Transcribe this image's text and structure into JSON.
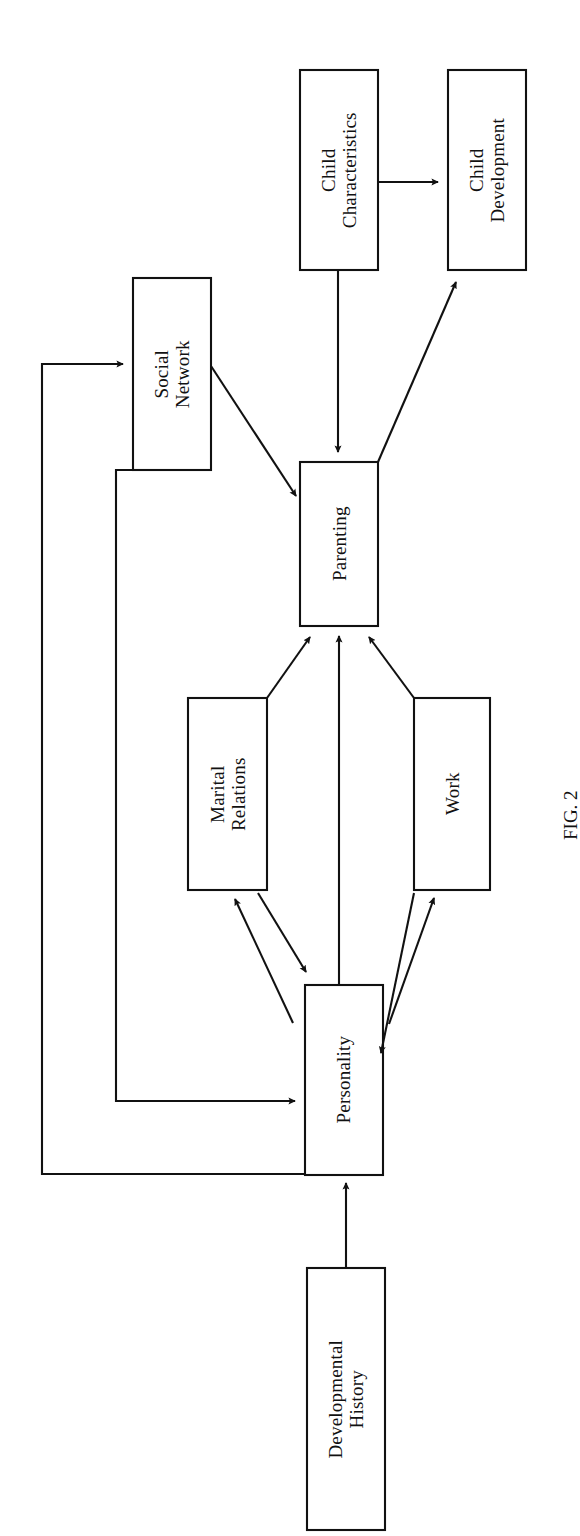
{
  "figure": {
    "caption": "FIG. 2",
    "orientation_degrees": -90,
    "background_color": "#ffffff",
    "line_color": "#111111",
    "text_color": "#111111"
  },
  "nodes": [
    {
      "id": "child-characteristics",
      "label": "Child\nCharacteristics",
      "x": 300,
      "y": 70,
      "w": 78,
      "h": 200
    },
    {
      "id": "child-development",
      "label": "Child\nDevelopment",
      "x": 448,
      "y": 70,
      "w": 78,
      "h": 200
    },
    {
      "id": "social-network",
      "label": "Social\nNetwork",
      "x": 133,
      "y": 278,
      "w": 78,
      "h": 192
    },
    {
      "id": "parenting",
      "label": "Parenting",
      "x": 300,
      "y": 462,
      "w": 78,
      "h": 164
    },
    {
      "id": "marital-relations",
      "label": "Marital\nRelations",
      "x": 188,
      "y": 698,
      "w": 79,
      "h": 192
    },
    {
      "id": "work",
      "label": "Work",
      "x": 414,
      "y": 698,
      "w": 76,
      "h": 192
    },
    {
      "id": "personality",
      "label": "Personality",
      "x": 305,
      "y": 985,
      "w": 78,
      "h": 190
    },
    {
      "id": "developmental-history",
      "label": "Developmental\nHistory",
      "x": 307,
      "y": 1268,
      "w": 78,
      "h": 262
    }
  ],
  "edges": [
    {
      "id": "developmental-history-to-personality",
      "from": "developmental-history",
      "to": "personality",
      "arrows": "one-way"
    },
    {
      "id": "personality-to-parenting",
      "from": "personality",
      "to": "parenting",
      "arrows": "one-way"
    },
    {
      "id": "personality-to-marital-relations",
      "from": "personality",
      "to": "marital-relations",
      "arrows": "two-way"
    },
    {
      "id": "personality-to-work",
      "from": "personality",
      "to": "work",
      "arrows": "two-way"
    },
    {
      "id": "personality-to-social-network",
      "from": "personality",
      "to": "social-network",
      "arrows": "one-way"
    },
    {
      "id": "social-network-to-personality",
      "from": "social-network",
      "to": "personality",
      "arrows": "one-way"
    },
    {
      "id": "marital-relations-to-parenting",
      "from": "marital-relations",
      "to": "parenting",
      "arrows": "one-way"
    },
    {
      "id": "work-to-parenting",
      "from": "work",
      "to": "parenting",
      "arrows": "one-way"
    },
    {
      "id": "social-network-to-parenting",
      "from": "social-network",
      "to": "parenting",
      "arrows": "one-way"
    },
    {
      "id": "child-characteristics-to-parenting",
      "from": "child-characteristics",
      "to": "parenting",
      "arrows": "one-way"
    },
    {
      "id": "child-characteristics-to-child-development",
      "from": "child-characteristics",
      "to": "child-development",
      "arrows": "one-way"
    },
    {
      "id": "parenting-to-child-development",
      "from": "parenting",
      "to": "child-development",
      "arrows": "one-way"
    }
  ]
}
